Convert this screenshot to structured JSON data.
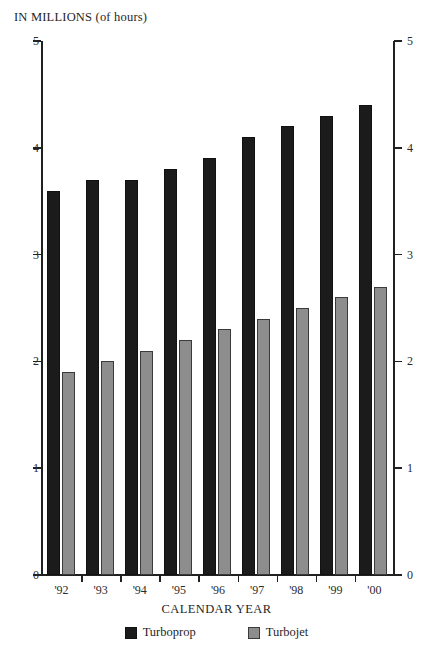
{
  "chart_data": {
    "type": "bar",
    "title": "",
    "ylabel": "IN MILLIONS (of hours)",
    "xlabel": "CALENDAR YEAR",
    "categories": [
      "'92",
      "'93",
      "'94",
      "'95",
      "'96",
      "'97",
      "'98",
      "'99",
      "'00"
    ],
    "series": [
      {
        "name": "Turboprop",
        "color": "#1b1b1b",
        "values": [
          3.6,
          3.7,
          3.7,
          3.8,
          3.9,
          4.1,
          4.2,
          4.3,
          4.4
        ]
      },
      {
        "name": "Turbojet",
        "color": "#8d8d8d",
        "values": [
          1.9,
          2.0,
          2.1,
          2.2,
          2.3,
          2.4,
          2.5,
          2.6,
          2.7
        ]
      }
    ],
    "ylim": [
      0,
      5
    ],
    "yticks": [
      "0",
      "1",
      "2",
      "3",
      "4",
      "5"
    ],
    "grid": false,
    "legend_position": "bottom-center",
    "dual_y_axis": true
  },
  "axes": {
    "top_label": "IN MILLIONS (of hours)",
    "bottom_label": "CALENDAR YEAR"
  },
  "legend": {
    "entries": [
      {
        "label": "Turboprop",
        "swatch": "black-square-icon"
      },
      {
        "label": "Turbojet",
        "swatch": "gray-square-icon"
      }
    ]
  }
}
